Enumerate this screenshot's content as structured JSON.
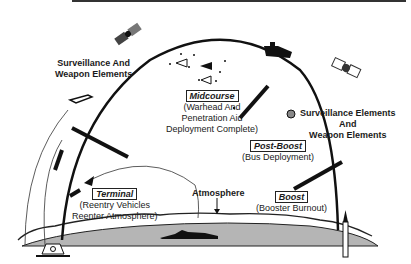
{
  "diagram": {
    "labels": {
      "surveillance_left": [
        "Surveillance And",
        "Weapon Elements"
      ],
      "surveillance_right": [
        "Surveillance Elements",
        "And",
        "Weapon Elements"
      ],
      "atmosphere": "Atmosphere"
    },
    "phases": [
      {
        "name": "Midcourse",
        "description": [
          "(Warhead And",
          "Penetration Aid",
          "Deployment Complete)"
        ]
      },
      {
        "name": "Post-Boost",
        "description": [
          "(Bus Deployment)"
        ]
      },
      {
        "name": "Boost",
        "description": [
          "(Booster Burnout)"
        ]
      },
      {
        "name": "Terminal",
        "description": [
          "(Reentry Vehicles",
          "Reenter Atmosphere)"
        ]
      }
    ],
    "icons": [
      "satellite-left",
      "satellite-right",
      "space-platform",
      "warhead-bus",
      "reentry-vehicles",
      "submarine",
      "missile-launcher",
      "ground-radar-site",
      "interceptor-missile"
    ],
    "colors": {
      "ink": "#1a1a1a",
      "earth": "#b5b5b5",
      "background": "#ffffff"
    }
  }
}
